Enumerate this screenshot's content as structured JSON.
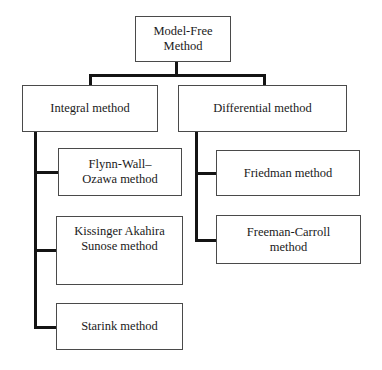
{
  "diagram": {
    "type": "hierarchy-tree",
    "orientation": "top-down",
    "colors": {
      "box_border": "#4a4a4a",
      "connector": "#141414",
      "text": "#1a1a1a",
      "background": "#ffffff"
    },
    "root": {
      "label": "Model-Free\nMethod"
    },
    "branches": [
      {
        "label": "Integral method",
        "children": [
          {
            "label": "Flynn-Wall–\nOzawa method"
          },
          {
            "label": "Kissinger Akahira\nSunose  method"
          },
          {
            "label": "Starink method"
          }
        ]
      },
      {
        "label": "Differential method",
        "children": [
          {
            "label": "Friedman method"
          },
          {
            "label": "Freeman-Carroll\nmethod"
          }
        ]
      }
    ]
  }
}
